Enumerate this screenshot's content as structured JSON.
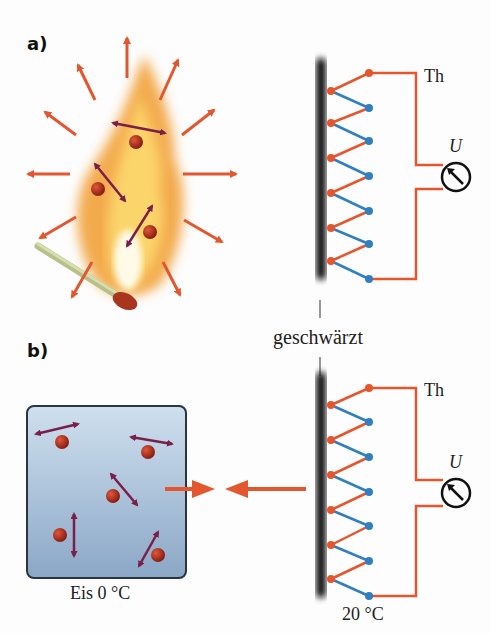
{
  "labels": {
    "part_a": "a)",
    "part_b": "b)",
    "blackened": "geschwärzt",
    "thermopile_top": "Th",
    "thermopile_bottom": "Th",
    "voltage_top": "U",
    "voltage_bottom": "U",
    "ice": "Eis 0 °C",
    "detector_temp": "20 °C"
  },
  "colors": {
    "orange": "#e4572e",
    "blue": "#2f7fc1",
    "molecule": "#a3261a",
    "arrow_molecule": "#7a1f4a",
    "ice_top": "#c9dcec",
    "ice_bottom": "#8aa6c6",
    "flame": "#f4a93a"
  },
  "diagram": {
    "panel_a": {
      "source": "burning match flame",
      "molecules": 3,
      "radiation_arrows": 12
    },
    "panel_b": {
      "source": "ice block",
      "molecules": 5,
      "net_radiation": "from detector to ice"
    },
    "thermopile_junctions": 6
  }
}
